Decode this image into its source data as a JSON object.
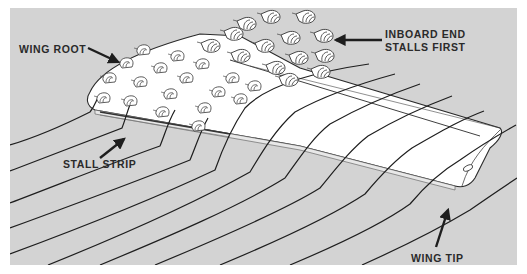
{
  "figure": {
    "background_color": "#d3d3d3",
    "wing_color": "#ffffff",
    "line_color": "#1e1e1e"
  },
  "labels": {
    "wing_root": "WING ROOT",
    "inboard_line1": "INBOARD END",
    "inboard_line2": "STALLS FIRST",
    "stall_strip": "STALL STRIP",
    "wing_tip": "WING TIP"
  },
  "icons": {
    "arrow": "pointer-arrow",
    "tuft": "airflow-tuft"
  }
}
